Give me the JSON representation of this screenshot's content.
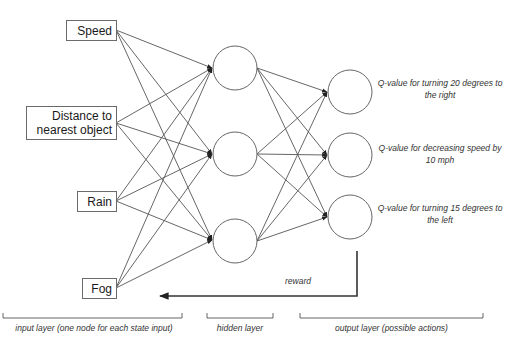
{
  "diagram": {
    "colors": {
      "stroke": "#555555",
      "box_border": "#6a6a6a",
      "text": "#1a1a1a",
      "background": "#ffffff"
    },
    "input_layer": {
      "nodes": [
        {
          "id": "speed",
          "label": "Speed"
        },
        {
          "id": "distance",
          "label": "Distance to nearest object"
        },
        {
          "id": "rain",
          "label": "Rain"
        },
        {
          "id": "fog",
          "label": "Fog"
        }
      ],
      "label": "input layer (one node for each state input)"
    },
    "hidden_layer": {
      "node_count": 3,
      "label": "hidden layer"
    },
    "output_layer": {
      "nodes": [
        {
          "id": "turn_right",
          "label": "Q-value for turning 20 degrees to the right"
        },
        {
          "id": "slow_down",
          "label": "Q-value for decreasing speed by 10 mph"
        },
        {
          "id": "turn_left",
          "label": "Q-value for turning 15 degrees to the left"
        }
      ],
      "label": "output layer (possible actions)"
    },
    "feedback": {
      "label": "reward"
    },
    "connectivity": "fully connected: input→hidden, hidden→output"
  }
}
